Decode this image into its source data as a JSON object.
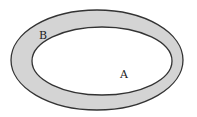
{
  "diagram": {
    "type": "nested-regions",
    "outer_region": {
      "label": "B",
      "shape": "ellipse",
      "cx": 97,
      "cy": 60,
      "rx": 86,
      "ry": 50,
      "fill": "#d4d4d4",
      "stroke": "#333333"
    },
    "inner_region": {
      "label": "A",
      "shape": "ellipse",
      "cx": 102,
      "cy": 61,
      "rx": 70,
      "ry": 34,
      "fill": "#ffffff",
      "stroke": "#333333"
    },
    "labels": [
      {
        "text": "B",
        "x": 39,
        "y": 39
      },
      {
        "text": "A",
        "x": 120,
        "y": 78
      }
    ]
  }
}
